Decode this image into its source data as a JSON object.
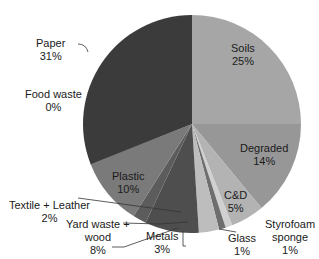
{
  "chart_data": {
    "type": "pie",
    "title": "",
    "start_angle_deg": 0,
    "direction": "clockwise",
    "slices": [
      {
        "label": "Soils",
        "value": 25,
        "display": "25%",
        "color": "#a6a6a6"
      },
      {
        "label": "Degraded",
        "value": 14,
        "display": "14%",
        "color": "#979797"
      },
      {
        "label": "C&D",
        "value": 5,
        "display": "5%",
        "color": "#b3b3b3"
      },
      {
        "label": "Styrofoam sponge",
        "value": 1,
        "display": "1%",
        "color": "#d0d0d0"
      },
      {
        "label": "Glass",
        "value": 1,
        "display": "1%",
        "color": "#6e6e6e"
      },
      {
        "label": "Metals",
        "value": 3,
        "display": "3%",
        "color": "#bdbdbd"
      },
      {
        "label": "Yard waste + wood",
        "value": 8,
        "display": "8%",
        "color": "#4e4e4e"
      },
      {
        "label": "Textile + Leather",
        "value": 2,
        "display": "2%",
        "color": "#5c5c5c"
      },
      {
        "label": "Plastic",
        "value": 10,
        "display": "10%",
        "color": "#7a7a7a"
      },
      {
        "label": "Food waste",
        "value": 0,
        "display": "0%",
        "color": "#3a3a3a"
      },
      {
        "label": "Paper",
        "value": 31,
        "display": "31%",
        "color": "#3b3b3b"
      }
    ]
  },
  "labels": {
    "soils": {
      "name": "Soils",
      "pct": "25%"
    },
    "degraded": {
      "name": "Degraded",
      "pct": "14%"
    },
    "cd": {
      "name": "C&D",
      "pct": "5%"
    },
    "styrofoam": {
      "name1": "Styrofoam",
      "name2": "sponge",
      "pct": "1%"
    },
    "glass": {
      "name": "Glass",
      "pct": "1%"
    },
    "metals": {
      "name": "Metals",
      "pct": "3%"
    },
    "yard": {
      "name1": "Yard waste +",
      "name2": "wood",
      "pct": "8%"
    },
    "textile": {
      "name": "Textile + Leather",
      "pct": "2%"
    },
    "plastic": {
      "name": "Plastic",
      "pct": "10%"
    },
    "food": {
      "name": "Food waste",
      "pct": "0%"
    },
    "paper": {
      "name": "Paper",
      "pct": "31%"
    }
  }
}
